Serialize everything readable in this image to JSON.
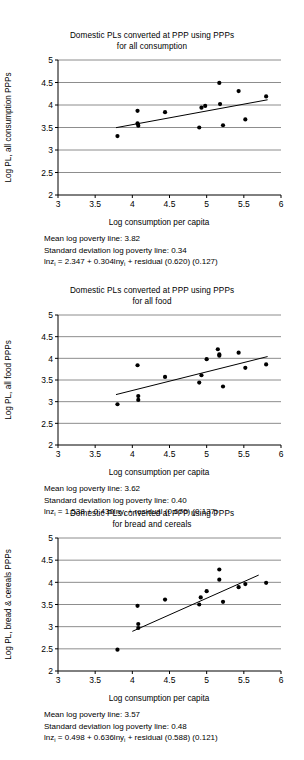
{
  "page": {
    "background": "#ffffff",
    "ink": "#000000",
    "gridline_color": "#808080",
    "axis_color": "#000000",
    "marker_color": "#000000",
    "fit_line_color": "#000000"
  },
  "figures": [
    {
      "id": "all-consumption",
      "title": "Domestic PLs converted at PPP using PPPs\nfor all consumption",
      "caption": {
        "mean_line": "Mean log poverty line: 3.82",
        "sd_line": "Standard deviation log poverty line: 0.34",
        "equation_prefix": "lnz",
        "equation_sub1": "i",
        "equation_mid": " = 2.347 + 0.304lny",
        "equation_sub2": "i",
        "equation_suffix": " + residual (0.620) (0.127)"
      },
      "chart_data": {
        "type": "scatter",
        "title": "Domestic PLs converted at PPP using PPPs for all consumption",
        "xlabel": "Log consumption per capita",
        "ylabel": "Log PL, all consumption PPPs",
        "xlim": [
          3,
          6
        ],
        "ylim": [
          2,
          5
        ],
        "xticks": [
          "3",
          "3.5",
          "4",
          "4.5",
          "5",
          "5.5",
          "6"
        ],
        "xtick_values": [
          3,
          3.5,
          4,
          4.5,
          5,
          5.5,
          6
        ],
        "yticks": [
          "2",
          "2.5",
          "3",
          "3.5",
          "4",
          "4.5",
          "5"
        ],
        "ytick_values": [
          2,
          2.5,
          3,
          3.5,
          4,
          4.5,
          5
        ],
        "grid": "horizontal",
        "legend": "none",
        "points": [
          [
            3.8,
            3.31
          ],
          [
            4.07,
            3.87
          ],
          [
            4.07,
            3.59
          ],
          [
            4.08,
            3.54
          ],
          [
            4.44,
            3.84
          ],
          [
            4.9,
            3.5
          ],
          [
            4.93,
            3.94
          ],
          [
            4.98,
            3.98
          ],
          [
            5.17,
            4.49
          ],
          [
            5.18,
            4.02
          ],
          [
            5.22,
            3.55
          ],
          [
            5.43,
            4.31
          ],
          [
            5.52,
            3.68
          ],
          [
            5.8,
            4.19
          ]
        ],
        "fit_line": {
          "intercept": 2.347,
          "slope": 0.304,
          "x_start": 3.78,
          "x_end": 5.82,
          "y_start": 3.496,
          "y_end": 4.116
        },
        "annotations": {
          "mean_log_poverty_line": 3.82,
          "sd_log_poverty_line": 0.34,
          "residual_se": 0.62,
          "slope_se": 0.127
        }
      }
    },
    {
      "id": "all-food",
      "title": "Domestic PLs converted at PPP using PPPs\nfor all food",
      "caption": {
        "mean_line": "Mean log poverty line: 3.62",
        "sd_line": "Standard deviation log poverty line: 0.40",
        "equation_prefix": "lnz",
        "equation_sub1": "i",
        "equation_mid": " = 1.538 + 0.430lny",
        "equation_sub2": "i",
        "equation_suffix": " + residual (0.670) (0.137)"
      },
      "chart_data": {
        "type": "scatter",
        "title": "Domestic PLs converted at PPP using PPPs for all food",
        "xlabel": "Log consumption per capita",
        "ylabel": "Log PL, all food PPPs",
        "xlim": [
          3,
          6
        ],
        "ylim": [
          2,
          5
        ],
        "xticks": [
          "3",
          "3.5",
          "4",
          "4.5",
          "5",
          "5.5",
          "6"
        ],
        "xtick_values": [
          3,
          3.5,
          4,
          4.5,
          5,
          5.5,
          6
        ],
        "yticks": [
          "2",
          "2.5",
          "3",
          "3.5",
          "4",
          "4.5",
          "5"
        ],
        "ytick_values": [
          2,
          2.5,
          3,
          3.5,
          4,
          4.5,
          5
        ],
        "grid": "horizontal",
        "legend": "none",
        "points": [
          [
            3.8,
            2.94
          ],
          [
            4.07,
            3.84
          ],
          [
            4.08,
            3.13
          ],
          [
            4.08,
            3.04
          ],
          [
            4.44,
            3.57
          ],
          [
            4.9,
            3.44
          ],
          [
            4.93,
            3.61
          ],
          [
            5.0,
            3.98
          ],
          [
            5.15,
            4.21
          ],
          [
            5.17,
            4.09
          ],
          [
            5.17,
            4.06
          ],
          [
            5.22,
            3.35
          ],
          [
            5.43,
            4.13
          ],
          [
            5.52,
            3.78
          ],
          [
            5.8,
            3.86
          ]
        ],
        "fit_line": {
          "intercept": 1.538,
          "slope": 0.43,
          "x_start": 3.78,
          "x_end": 5.82,
          "y_start": 3.163,
          "y_end": 4.041
        },
        "annotations": {
          "mean_log_poverty_line": 3.62,
          "sd_log_poverty_line": 0.4,
          "residual_se": 0.67,
          "slope_se": 0.137
        }
      }
    },
    {
      "id": "bread-and-cereals",
      "title": "Domestic PLs converted at PPP using PPPs\nfor bread and cereals",
      "caption": {
        "mean_line": "Mean log poverty line: 3.57",
        "sd_line": "Standard deviation log poverty line: 0.48",
        "equation_prefix": "lnz",
        "equation_sub1": "i",
        "equation_mid": " = 0.498 + 0.636lny",
        "equation_sub2": "i",
        "equation_suffix": " + residual (0.588) (0.121)"
      },
      "chart_data": {
        "type": "scatter",
        "title": "Domestic PLs converted at PPP using PPPs for bread and cereals",
        "xlabel": "Log consumption per capita",
        "ylabel": "Log PL, bread & cereals PPPs",
        "xlim": [
          3,
          6
        ],
        "ylim": [
          2,
          5
        ],
        "xticks": [
          "3",
          "3.5",
          "4",
          "4.5",
          "5",
          "5.5",
          "6"
        ],
        "xtick_values": [
          3,
          3.5,
          4,
          4.5,
          5,
          5.5,
          6
        ],
        "yticks": [
          "2",
          "2.5",
          "3",
          "3.5",
          "4",
          "4.5",
          "5"
        ],
        "ytick_values": [
          2,
          2.5,
          3,
          3.5,
          4,
          4.5,
          5
        ],
        "grid": "horizontal",
        "legend": "none",
        "points": [
          [
            3.8,
            2.48
          ],
          [
            4.07,
            3.47
          ],
          [
            4.08,
            3.06
          ],
          [
            4.08,
            2.97
          ],
          [
            4.44,
            3.61
          ],
          [
            4.9,
            3.5
          ],
          [
            4.92,
            3.66
          ],
          [
            5.0,
            3.8
          ],
          [
            5.17,
            4.29
          ],
          [
            5.17,
            4.06
          ],
          [
            5.22,
            3.56
          ],
          [
            5.43,
            3.89
          ],
          [
            5.52,
            3.96
          ],
          [
            5.8,
            3.99
          ]
        ],
        "fit_line": {
          "intercept": 0.498,
          "slope": 0.636,
          "x_start": 4.0,
          "x_end": 5.7,
          "y_start": 2.894,
          "y_end": 4.164
        },
        "annotations": {
          "mean_log_poverty_line": 3.57,
          "sd_log_poverty_line": 0.48,
          "residual_se": 0.588,
          "slope_se": 0.121
        }
      }
    }
  ]
}
